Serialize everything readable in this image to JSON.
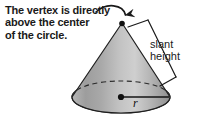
{
  "figure": {
    "title_callout": "The vertex is directly\nabove the center\nof the circle.",
    "slant_height_label": "slant\nheight",
    "radius_label": "r",
    "shape": "cone",
    "colors": {
      "text": "#1a1a1a",
      "outline": "#1f1f1f",
      "cone_light": "#c9c9c9",
      "cone_mid": "#a8a8a8",
      "cone_dark": "#8d8d8d",
      "base_fill": "#9b9b9b",
      "background": "#ffffff"
    },
    "geometry": {
      "apex_x": 122,
      "apex_y": 23,
      "base_center_x": 121,
      "base_center_y": 97,
      "base_rx": 49,
      "base_ry": 16,
      "radius_line_end_x": 170,
      "radius_line_end_y": 97
    },
    "annotations": {
      "arrow": "curved-arrow-to-vertex",
      "hidden_edge": "dashed-back-ellipse",
      "center_dot": "base-center-point",
      "apex_dot": "vertex-point",
      "slant_bracket": "slant-height-bracket"
    }
  }
}
